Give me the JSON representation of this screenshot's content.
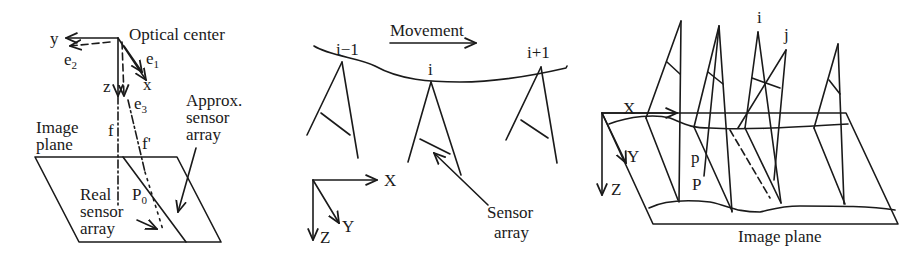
{
  "figure": {
    "panel_a": {
      "optical_center": "Optical center",
      "axis_y": "y",
      "axis_x": "x",
      "axis_z": "z",
      "e1": "e",
      "e1_sub": "1",
      "e2": "e",
      "e2_sub": "2",
      "e3": "e",
      "e3_sub": "3",
      "f": "f",
      "f_prime": "f'",
      "image_plane_1": "Image",
      "image_plane_2": "plane",
      "approx_1": "Approx.",
      "approx_2": "sensor",
      "approx_3": "array",
      "p0": "P",
      "p0_sub": "0",
      "real_1": "Real",
      "real_2": "sensor",
      "real_3": "array"
    },
    "panel_b": {
      "movement": "Movement",
      "i_minus": "i−1",
      "i": "i",
      "i_plus": "i+1",
      "axis_x": "X",
      "axis_y": "Y",
      "axis_z": "Z",
      "sensor_1": "Sensor",
      "sensor_2": "array"
    },
    "panel_c": {
      "i": "i",
      "j": "j",
      "axis_x": "X",
      "axis_y": "Y",
      "axis_z": "Z",
      "p_small": "p",
      "p_big": "P",
      "image_plane": "Image plane"
    }
  }
}
